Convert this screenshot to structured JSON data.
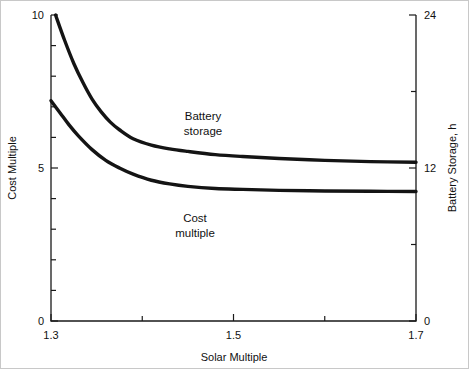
{
  "chart_data": {
    "type": "line",
    "title": "",
    "xlabel": "Solar Multiple",
    "ylabel": "Cost Multiple",
    "y2label": "Battery Storage, h",
    "xlim": [
      1.3,
      1.7
    ],
    "ylim": [
      0,
      10
    ],
    "y2lim": [
      0,
      24
    ],
    "grid": false,
    "legend_position": "inline-annotations",
    "x_ticks_major": [
      "1.3",
      "1.5",
      "1.7"
    ],
    "x_ticks_major_values": [
      1.3,
      1.5,
      1.7
    ],
    "x_ticks_minor_values": [
      1.4,
      1.6
    ],
    "y_ticks_major": [
      "0",
      "5",
      "10"
    ],
    "y_ticks_major_values": [
      0,
      5,
      10
    ],
    "y_ticks_minor_values": [
      1,
      2,
      3,
      4,
      6,
      7,
      8,
      9
    ],
    "y2_ticks_major": [
      "0",
      "12",
      "24"
    ],
    "y2_ticks_major_values": [
      0,
      12,
      24
    ],
    "y2_ticks_minor_values": [
      6,
      18
    ],
    "annotations": [
      {
        "text_line1": "Battery",
        "text_line2": "storage",
        "x": 1.46,
        "y": 6.9
      },
      {
        "text_line1": "Cost",
        "text_line2": "multiple",
        "x": 1.45,
        "y": 3.3
      }
    ],
    "series": [
      {
        "name": "Battery storage",
        "axis": "right",
        "units": "h",
        "x": [
          1.305,
          1.315,
          1.325,
          1.335,
          1.345,
          1.355,
          1.365,
          1.375,
          1.39,
          1.41,
          1.43,
          1.45,
          1.48,
          1.51,
          1.55,
          1.6,
          1.65,
          1.7
        ],
        "values": [
          24.0,
          22.0,
          20.2,
          18.7,
          17.4,
          16.4,
          15.6,
          15.0,
          14.3,
          13.8,
          13.5,
          13.3,
          13.05,
          12.9,
          12.75,
          12.6,
          12.5,
          12.45
        ]
      },
      {
        "name": "Cost multiple",
        "axis": "left",
        "units": "",
        "x": [
          1.3,
          1.31,
          1.32,
          1.33,
          1.345,
          1.36,
          1.375,
          1.39,
          1.41,
          1.43,
          1.45,
          1.48,
          1.51,
          1.55,
          1.6,
          1.65,
          1.7
        ],
        "values": [
          7.2,
          6.8,
          6.4,
          6.05,
          5.6,
          5.25,
          5.0,
          4.8,
          4.6,
          4.48,
          4.4,
          4.33,
          4.3,
          4.27,
          4.25,
          4.24,
          4.23
        ]
      }
    ]
  },
  "axes": {
    "left_title": "Cost Multiple",
    "right_title": "Battery Storage, h",
    "bottom_title": "Solar Multiple"
  },
  "ticks": {
    "x": [
      {
        "label": "1.3"
      },
      {
        "label": "1.5"
      },
      {
        "label": "1.7"
      }
    ],
    "y_left": [
      {
        "label": "10"
      },
      {
        "label": "5"
      },
      {
        "label": "0"
      }
    ],
    "y_right": [
      {
        "label": "24"
      },
      {
        "label": "12"
      },
      {
        "label": "0"
      }
    ]
  },
  "labels": {
    "battery_line1": "Battery",
    "battery_line2": "storage",
    "cost_line1": "Cost",
    "cost_line2": "multiple"
  },
  "colors": {
    "curve": "#141414",
    "axis": "#1a1a1a",
    "background": "#ffffff",
    "text": "#111111"
  }
}
